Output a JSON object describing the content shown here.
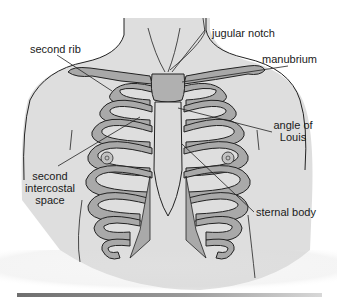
{
  "figure": {
    "labels": {
      "second_rib": "second rib",
      "jugular_notch": "jugular notch",
      "manubrium": "manubrium",
      "angle_of_louis_line1": "angle of",
      "angle_of_louis_line2": "Louis",
      "second_intercostal_line1": "second",
      "second_intercostal_line2": "intercostal",
      "second_intercostal_line3": "space",
      "sternal_body": "sternal body"
    },
    "colors": {
      "skin": "#e2e2e2",
      "bone": "#a9a9a9",
      "outline": "#222222",
      "background": "#ffffff"
    }
  }
}
